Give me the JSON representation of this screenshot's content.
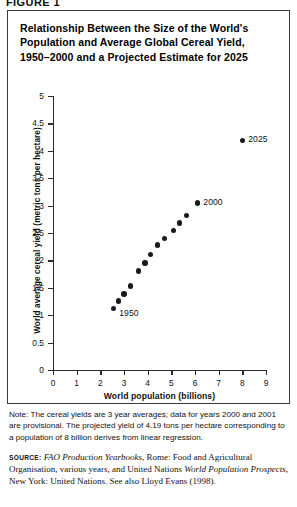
{
  "figure": {
    "label": "FIGURE 1",
    "title_lines": [
      "Relationship Between the Size of the World's",
      "Population and Average Global Cereal Yield,",
      "1950–2000 and a Projected Estimate for 2025"
    ]
  },
  "chart_data": {
    "type": "scatter",
    "title": "Relationship Between the Size of the World's Population and Average Global Cereal Yield, 1950–2000 and a Projected Estimate for 2025",
    "xlabel": "World population (billions)",
    "ylabel": "World average cereal yield (metric tons per hectare)",
    "xlim": [
      0,
      9
    ],
    "ylim": [
      0,
      5
    ],
    "xticks": [
      0,
      1,
      2,
      3,
      4,
      5,
      6,
      7,
      8,
      9
    ],
    "xtick_labels": [
      "0",
      "1",
      "2",
      "3",
      "4",
      "5",
      "6",
      "7",
      "8",
      "9"
    ],
    "yticks": [
      0,
      0.5,
      1,
      1.5,
      2,
      2.5,
      3,
      3.5,
      4,
      4.5,
      5
    ],
    "ytick_labels": [
      "0",
      "0.5",
      "1",
      "1.5",
      "2",
      "2.5",
      "3",
      "3.5",
      "4",
      "4.5",
      "5"
    ],
    "grid": false,
    "legend": "none",
    "marker_color": "#1a1a1a",
    "series": [
      {
        "name": "Observed 1950–2000",
        "x": [
          2.55,
          2.78,
          3.0,
          3.28,
          3.6,
          3.88,
          4.12,
          4.42,
          4.72,
          5.08,
          5.35,
          5.65,
          6.1
        ],
        "y": [
          1.12,
          1.26,
          1.39,
          1.53,
          1.81,
          1.95,
          2.11,
          2.28,
          2.4,
          2.55,
          2.68,
          2.82,
          3.05
        ]
      },
      {
        "name": "Projected 2025",
        "x": [
          8.0
        ],
        "y": [
          4.19
        ]
      }
    ],
    "annotations": [
      {
        "text": "1950",
        "x": 2.55,
        "y": 1.12
      },
      {
        "text": "2000",
        "x": 6.1,
        "y": 3.05
      },
      {
        "text": "2025",
        "x": 8.0,
        "y": 4.19
      }
    ]
  },
  "note": {
    "text": "Note: The cereal yields are 3 year averages; data for years 2000 and 2001 are provisional. The projected yield of 4.19 tons per hectare corresponding to a population of 8 billion derives from linear regression."
  },
  "source": {
    "kicker": "source:",
    "part1_italic": "FAO Production Yearbooks",
    "part2": ", Rome: Food and Agricultural Organisation, various years, and United Nations ",
    "part3_italic": "World Population Prospects",
    "part4": ", New York: United Nations. See also Lloyd Evans (1998)."
  }
}
